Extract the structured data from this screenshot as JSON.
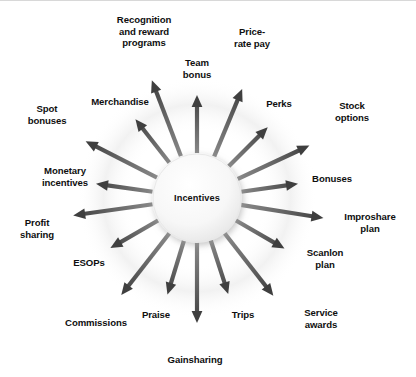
{
  "diagram": {
    "type": "radial-hub-and-spoke",
    "title": "Incentives",
    "center": {
      "label": "Incentives",
      "cx": 197,
      "cy": 197,
      "r": 45,
      "fill": "#f4f4f4"
    },
    "style": {
      "background": "#ffffff",
      "arrow_color": "#3f3f3f",
      "arrow_color_light": "#8c8c8c",
      "text_color": "#0f0f0f",
      "glow_color": "#e9e9e9"
    },
    "arrow_count": 16,
    "spokes": [
      {
        "label": "Team\nbonus",
        "angle": -90,
        "label_x": 197,
        "label_y": 68,
        "tip": 103
      },
      {
        "label": "Price-\nrate pay",
        "angle": -67.5,
        "label_x": 252,
        "label_y": 37,
        "tip": 118
      },
      {
        "label": "Perks",
        "angle": -45,
        "label_x": 279,
        "label_y": 103,
        "tip": 100
      },
      {
        "label": "Stock\noptions",
        "angle": -25,
        "label_x": 352,
        "label_y": 111,
        "tip": 124
      },
      {
        "label": "Bonuses",
        "angle": -8,
        "label_x": 332,
        "label_y": 178,
        "tip": 102
      },
      {
        "label": "Improshare\nplan",
        "angle": 9,
        "label_x": 370,
        "label_y": 222,
        "tip": 128
      },
      {
        "label": "Scanlon\nplan",
        "angle": 30,
        "label_x": 325,
        "label_y": 258,
        "tip": 101
      },
      {
        "label": "Service\nawards",
        "angle": 52,
        "label_x": 321,
        "label_y": 318,
        "tip": 124
      },
      {
        "label": "Trips",
        "angle": 72,
        "label_x": 243,
        "label_y": 314,
        "tip": 101
      },
      {
        "label": "Gainsharing",
        "angle": 90,
        "label_x": 195,
        "label_y": 359,
        "tip": 125
      },
      {
        "label": "Praise",
        "angle": 107,
        "label_x": 156,
        "label_y": 314,
        "tip": 101
      },
      {
        "label": "Commissions",
        "angle": 128,
        "label_x": 96,
        "label_y": 322,
        "tip": 123
      },
      {
        "label": "ESOPs",
        "angle": 150,
        "label_x": 89,
        "label_y": 262,
        "tip": 100
      },
      {
        "label": "Profit\nsharing",
        "angle": 172,
        "label_x": 37,
        "label_y": 228,
        "tip": 125
      },
      {
        "label": "Monetary\nincentives",
        "angle": 188,
        "label_x": 65,
        "label_y": 176,
        "tip": 102
      },
      {
        "label": "Spot\nbonuses",
        "angle": 207,
        "label_x": 47,
        "label_y": 114,
        "tip": 125
      },
      {
        "label": "Merchandise",
        "angle": 232,
        "label_x": 120,
        "label_y": 101,
        "tip": 100
      },
      {
        "label": "Recognition\nand reward\nprograms",
        "angle": 249,
        "label_x": 144,
        "label_y": 30,
        "tip": 126
      }
    ]
  }
}
